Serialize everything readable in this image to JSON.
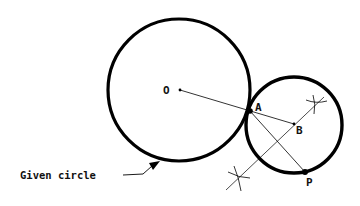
{
  "diagram": {
    "labels": {
      "O": "O",
      "A": "A",
      "B": "B",
      "P": "P",
      "given_circle": "Given circle"
    },
    "given_circle": {
      "center": [
        179,
        90
      ],
      "radius": 71
    },
    "tangent_circle": {
      "center": [
        294,
        125
      ],
      "radius": 48
    },
    "points": {
      "O": [
        180,
        90
      ],
      "A": [
        250,
        111
      ],
      "B": [
        294,
        124
      ],
      "P": [
        305,
        172
      ]
    },
    "arc_marks": [
      [
        316,
        104
      ],
      [
        239,
        178
      ]
    ],
    "colors": {
      "stroke": "#000000",
      "background": "#ffffff"
    }
  }
}
